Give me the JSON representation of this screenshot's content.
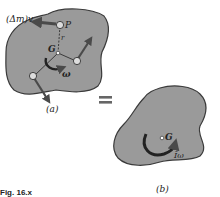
{
  "figure": {
    "panel_a": {
      "caption": "(a)",
      "labels": {
        "momentum": "(Δm)v",
        "point_p": "P",
        "radius": "r",
        "center": "G",
        "angular_velocity": "ω"
      }
    },
    "equals": "=",
    "panel_b": {
      "caption": "(b)",
      "labels": {
        "center": "G",
        "angular_momentum": "Īω"
      }
    },
    "figure_caption": "Fig. 16.x"
  },
  "colors": {
    "body_fill": "#9a9a9a",
    "outline": "#3a3a3a",
    "arrow": "#4a4a4a",
    "equals": "#666666"
  }
}
